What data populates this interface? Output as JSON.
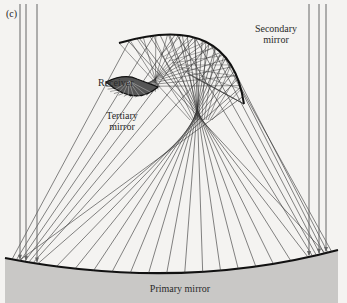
{
  "figure": {
    "panel_label": "(c)",
    "labels": {
      "secondary": [
        "Secondary",
        "mirror"
      ],
      "receiver": "Receiver",
      "tertiary": [
        "Tertiary",
        "mirror"
      ],
      "primary": "Primary mirror"
    },
    "colors": {
      "background": "#f4f3f1",
      "ray": "#333333",
      "incoming_ray": "#666666",
      "mirror_stroke": "#111111",
      "primary_fill": "#c9c8c6"
    },
    "incoming_rays_x_left": [
      20,
      26,
      37
    ],
    "incoming_rays_x_right": [
      309,
      319,
      326
    ],
    "primary_mirror": {
      "x1": 5,
      "y1": 258,
      "cx": 180,
      "cy": 292,
      "x2": 338,
      "y2": 250
    },
    "secondary_mirror": {
      "x1": 119,
      "y1": 43,
      "cx": 230,
      "cy": 10,
      "x2": 244,
      "y2": 104
    },
    "focus": {
      "x": 210,
      "y": 160
    },
    "tertiary_mirror": {
      "cx": 133,
      "cy": 85,
      "r": 27
    }
  }
}
